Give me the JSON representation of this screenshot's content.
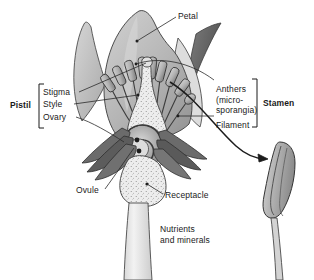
{
  "figure": {
    "kind": "botanical-diagram",
    "background_color": "#ffffff"
  },
  "palette": {
    "outline": "#3b3b3b",
    "petal_light": "#c9c9c9",
    "petal_mid": "#b0b0b0",
    "petal_shadow": "#8f8f8f",
    "sepal_dark": "#6e6e6e",
    "sepal_darker": "#555555",
    "pistil_pale": "#e8e8e8",
    "stem_pale": "#ededed",
    "ovary_mid": "#9a9a9a",
    "ovary_inner": "#c0c0c0",
    "anther_fill": "#bdbdbd",
    "text": "#1a1a1a",
    "leader_line": "#2b2b2b"
  },
  "labels": {
    "petal": "Petal",
    "pistil_group": "Pistil",
    "stigma": "Stigma",
    "style": "Style",
    "ovary": "Ovary",
    "anthers": "Anthers\n(micro-\nsporangia)",
    "filament": "Filament",
    "stamen_group": "Stamen",
    "ovule": "Ovule",
    "receptacle": "Receptacle",
    "nutrients": "Nutrients\nand minerals"
  },
  "parts": [
    {
      "id": "petal",
      "name": "Petal",
      "group": null
    },
    {
      "id": "stigma",
      "name": "Stigma",
      "group": "Pistil"
    },
    {
      "id": "style",
      "name": "Style",
      "group": "Pistil"
    },
    {
      "id": "ovary",
      "name": "Ovary",
      "group": "Pistil"
    },
    {
      "id": "anthers",
      "name": "Anthers (microsporangia)",
      "group": "Stamen"
    },
    {
      "id": "filament",
      "name": "Filament",
      "group": "Stamen"
    },
    {
      "id": "ovule",
      "name": "Ovule",
      "group": null
    },
    {
      "id": "receptacle",
      "name": "Receptacle",
      "group": null
    },
    {
      "id": "nutrients",
      "name": "Nutrients and minerals",
      "group": null
    }
  ],
  "callout": {
    "description": "magnified anther",
    "arrow": "curved-arrow-right"
  }
}
